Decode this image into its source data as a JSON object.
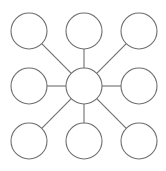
{
  "diagram": {
    "type": "hub-and-spoke",
    "stroke_color": "#6e6e6e",
    "fill_color": "#ffffff",
    "hub": {
      "cx": 84,
      "cy": 86,
      "r": 18
    },
    "nodes": [
      {
        "cx": 29,
        "cy": 31,
        "r": 18
      },
      {
        "cx": 84,
        "cy": 31,
        "r": 18
      },
      {
        "cx": 139,
        "cy": 31,
        "r": 18
      },
      {
        "cx": 29,
        "cy": 86,
        "r": 18
      },
      {
        "cx": 139,
        "cy": 86,
        "r": 18
      },
      {
        "cx": 29,
        "cy": 141,
        "r": 18
      },
      {
        "cx": 84,
        "cy": 141,
        "r": 18
      },
      {
        "cx": 139,
        "cy": 141,
        "r": 18
      }
    ]
  }
}
